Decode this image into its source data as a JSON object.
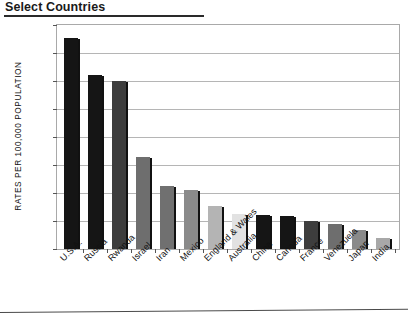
{
  "title": "Select Countries",
  "axis": {
    "ylabel": "RATES PER 100,000 POPULATION",
    "yticks": [
      "800",
      "700",
      "600",
      "500",
      "400",
      "300",
      "200",
      "100",
      "0"
    ]
  },
  "chart_data": {
    "type": "bar",
    "title": "Select Countries",
    "xlabel": "",
    "ylabel": "RATES PER 100,000 POPULATION",
    "ylim": [
      0,
      800
    ],
    "ytick_step": 100,
    "grid": true,
    "legend": "none",
    "categories": [
      "U.S.A.",
      "Russia",
      "Rwanda",
      "Israel",
      "Iran",
      "Mexico",
      "England & Wales",
      "Australia",
      "China",
      "Canada",
      "France",
      "Venezuela",
      "Japan",
      "India"
    ],
    "values": [
      755,
      620,
      600,
      330,
      225,
      210,
      155,
      125,
      120,
      118,
      100,
      88,
      68,
      38
    ],
    "bar_colors": [
      "#151515",
      "#151515",
      "#3d3d3d",
      "#6e6e6e",
      "#707070",
      "#8a8a8a",
      "#b4b4b4",
      "#e2e2e2",
      "#151515",
      "#151515",
      "#3d3d3d",
      "#6e6e6e",
      "#8a8a8a",
      "#a8a8a8"
    ]
  }
}
